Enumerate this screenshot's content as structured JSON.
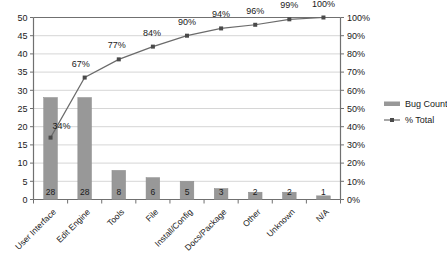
{
  "chart_data": {
    "type": "bar",
    "title": "",
    "subtitle": "",
    "xlabel": "",
    "ylabel": "",
    "y2label": "",
    "grid": true,
    "legend_position": "right",
    "categories": [
      "User Interface",
      "Edit Engine",
      "Tools",
      "File",
      "Install/Config",
      "Docs/Package",
      "Other",
      "Unknown",
      "N/A"
    ],
    "series": [
      {
        "name": "Bug Count",
        "type": "bar",
        "axis": "left",
        "color": "#989898",
        "values": [
          28,
          28,
          8,
          6,
          5,
          3,
          2,
          2,
          1
        ],
        "data_labels": [
          "28",
          "28",
          "8",
          "6",
          "5",
          "3",
          "2",
          "2",
          "1"
        ]
      },
      {
        "name": "% Total",
        "type": "line",
        "axis": "right",
        "color": "#6b6b6b",
        "marker": "square",
        "values": [
          34,
          67,
          77,
          84,
          90,
          94,
          96,
          99,
          100
        ],
        "data_labels": [
          "34%",
          "67%",
          "77%",
          "84%",
          "90%",
          "94%",
          "96%",
          "99%",
          "100%"
        ]
      }
    ],
    "yaxis_left": {
      "min": 0,
      "max": 50,
      "step": 5,
      "tick_labels": [
        "0",
        "5",
        "10",
        "15",
        "20",
        "25",
        "30",
        "35",
        "40",
        "45",
        "50"
      ]
    },
    "yaxis_right": {
      "min": 0,
      "max": 100,
      "step": 10,
      "tick_labels": [
        "0%",
        "10%",
        "20%",
        "30%",
        "40%",
        "50%",
        "60%",
        "70%",
        "80%",
        "90%",
        "100%"
      ]
    }
  },
  "legend": {
    "entries": [
      {
        "label": "Bug Count",
        "marker": "bar-swatch",
        "color": "#989898"
      },
      {
        "label": "% Total",
        "marker": "line-square",
        "color": "#6b6b6b"
      }
    ]
  },
  "colors": {
    "bar_fill": "#989898",
    "line_stroke": "#6b6b6b",
    "marker_fill": "#4a4a4a",
    "gridline": "#d6d6d6",
    "axis": "#707070",
    "text": "#1a1a1a",
    "background": "#ffffff"
  }
}
